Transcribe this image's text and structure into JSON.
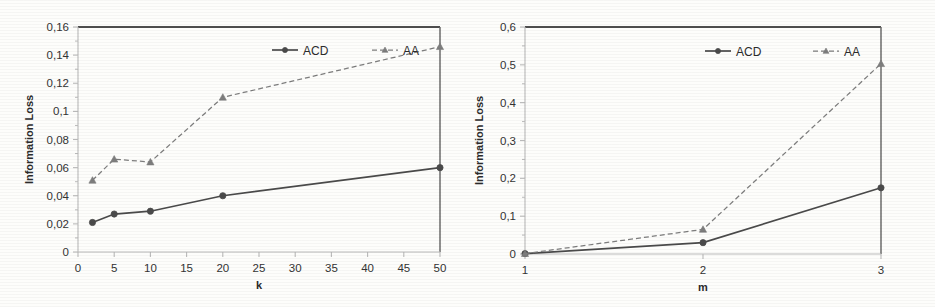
{
  "figure": {
    "background": "#fdfdfb",
    "ink": "#3a3a3a",
    "axis_color": "#b9b9b9",
    "panels": 2
  },
  "chart_data": [
    {
      "type": "line",
      "title": "",
      "xlabel": "k",
      "ylabel": "Information Loss",
      "x": [
        2,
        5,
        10,
        20,
        50
      ],
      "xlim": [
        0,
        50
      ],
      "ylim": [
        0,
        0.16
      ],
      "xticks": [
        0,
        5,
        10,
        15,
        20,
        25,
        30,
        35,
        40,
        45,
        50
      ],
      "xticklabels": [
        "0",
        "5",
        "10",
        "15",
        "20",
        "25",
        "30",
        "35",
        "40",
        "45",
        "50"
      ],
      "yticks": [
        0,
        0.02,
        0.04,
        0.06,
        0.08,
        0.1,
        0.12,
        0.14,
        0.16
      ],
      "yticklabels": [
        "0",
        "0,02",
        "0,04",
        "0,06",
        "0,08",
        "0,1",
        "0,12",
        "0,14",
        "0,16"
      ],
      "grid": false,
      "legend_position": "upper center",
      "series": [
        {
          "name": "ACD",
          "marker": "circle",
          "linestyle": "solid",
          "color": "#4a4a4a",
          "values": [
            0.021,
            0.027,
            0.029,
            0.04,
            0.06
          ]
        },
        {
          "name": "AA",
          "marker": "triangle",
          "linestyle": "dashed",
          "color": "#7d7d7d",
          "values": [
            0.051,
            0.066,
            0.064,
            0.11,
            0.146
          ]
        }
      ]
    },
    {
      "type": "line",
      "title": "",
      "xlabel": "m",
      "ylabel": "Information Loss",
      "x": [
        1,
        2,
        3
      ],
      "xlim": [
        1,
        3
      ],
      "ylim": [
        0,
        0.6
      ],
      "xticks": [
        1,
        2,
        3
      ],
      "xticklabels": [
        "1",
        "2",
        "3"
      ],
      "yticks": [
        0,
        0.1,
        0.2,
        0.3,
        0.4,
        0.5,
        0.6
      ],
      "yticklabels": [
        "0",
        "0,1",
        "0,2",
        "0,3",
        "0,4",
        "0,5",
        "0,6"
      ],
      "grid": false,
      "legend_position": "upper center",
      "series": [
        {
          "name": "ACD",
          "marker": "circle",
          "linestyle": "solid",
          "color": "#4a4a4a",
          "values": [
            0.001,
            0.03,
            0.175
          ]
        },
        {
          "name": "AA",
          "marker": "triangle",
          "linestyle": "dashed",
          "color": "#7d7d7d",
          "values": [
            0.001,
            0.065,
            0.503
          ]
        }
      ]
    }
  ]
}
